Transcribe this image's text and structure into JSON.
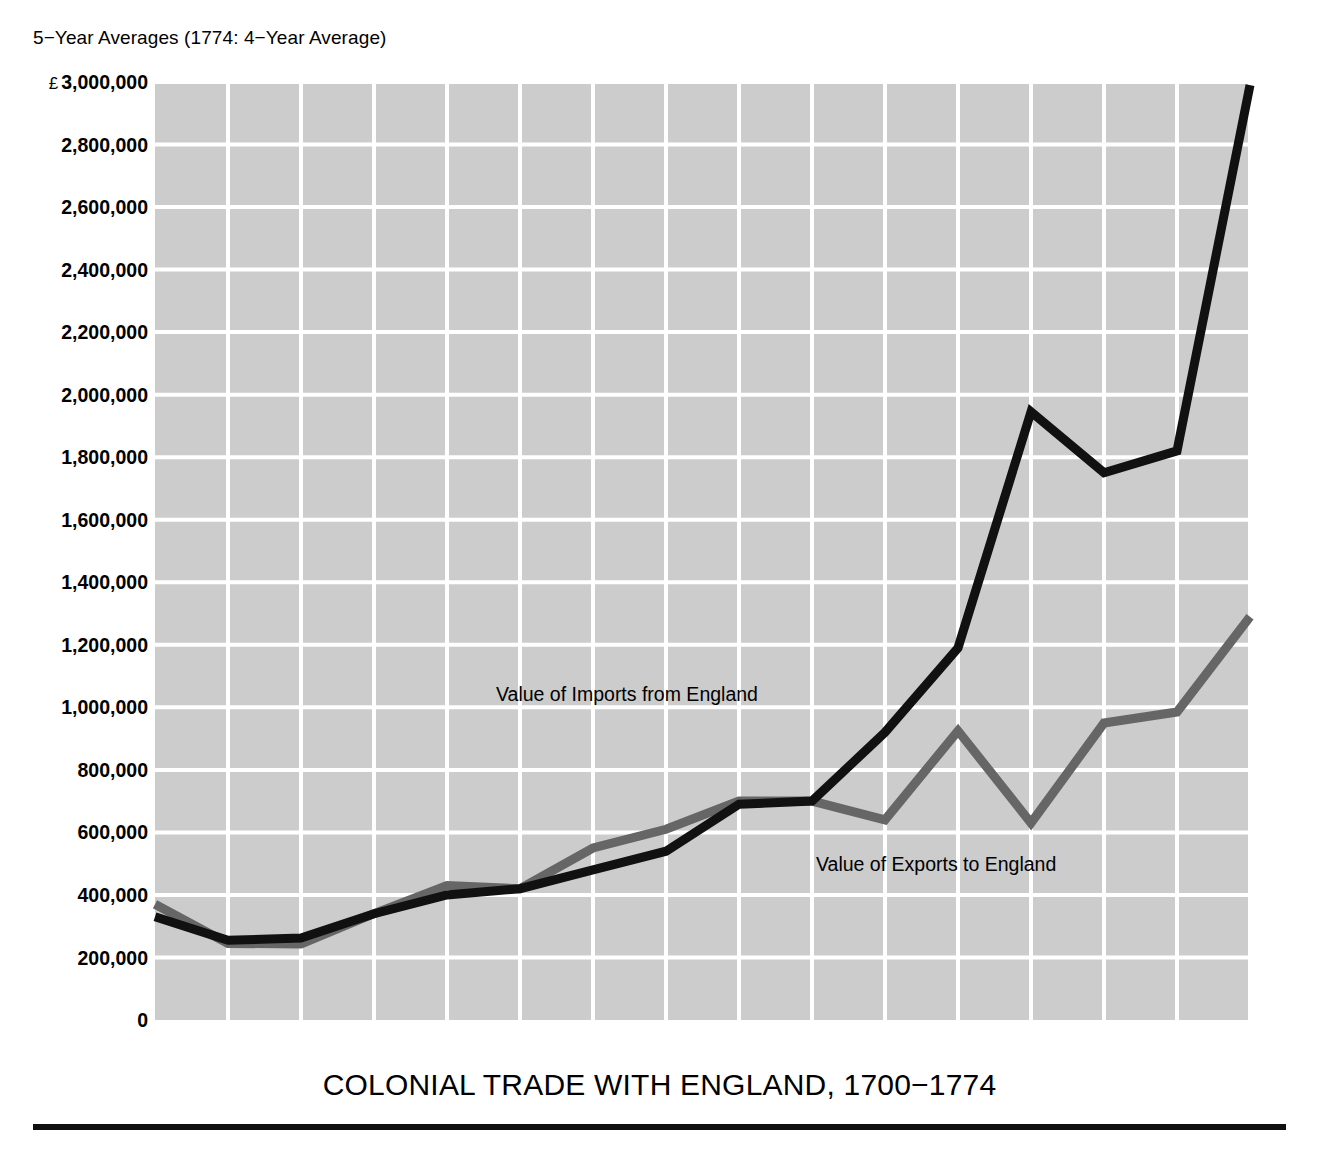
{
  "subtitle": "5−Year Averages (1774: 4−Year Average)",
  "title": "COLONIAL TRADE WITH ENGLAND, 1700−1774",
  "currency_symbol": "£",
  "colors": {
    "plot_background": "#cccccc",
    "gridline": "#ffffff",
    "imports_line": "#111111",
    "exports_line": "#666666",
    "text": "#000000",
    "rule": "#111111"
  },
  "annotations": {
    "imports_label": "Value of Imports from England",
    "exports_label": "Value of Exports to England"
  },
  "chart_data": {
    "type": "line",
    "title": "COLONIAL TRADE WITH ENGLAND, 1700−1774",
    "subtitle": "5−Year Averages (1774: 4−Year Average)",
    "xlabel": "",
    "ylabel": "£",
    "grid": true,
    "legend": "annotated-inline",
    "x": [
      1700,
      1705,
      1710,
      1715,
      1720,
      1725,
      1730,
      1735,
      1740,
      1745,
      1750,
      1755,
      1760,
      1765,
      1770,
      1774
    ],
    "xtick_labels": [
      "1700",
      "1705",
      "1710",
      "1715",
      "1720",
      "1725",
      "1730",
      "1735",
      "1740",
      "1745",
      "1750",
      "1755",
      "1760",
      "1765",
      "1770",
      "1774"
    ],
    "xlim": [
      1700,
      1774
    ],
    "ylim": [
      0,
      3000000
    ],
    "ytick_values": [
      0,
      200000,
      400000,
      600000,
      800000,
      1000000,
      1200000,
      1400000,
      1600000,
      1800000,
      2000000,
      2200000,
      2400000,
      2600000,
      2800000,
      3000000
    ],
    "ytick_labels": [
      "0",
      "200,000",
      "400,000",
      "600,000",
      "800,000",
      "1,000,000",
      "1,200,000",
      "1,400,000",
      "1,600,000",
      "1,800,000",
      "2,000,000",
      "2,200,000",
      "2,400,000",
      "2,600,000",
      "2,800,000",
      "£ 3,000,000"
    ],
    "series": [
      {
        "name": "Value of Imports from England",
        "color": "#111111",
        "values": [
          330000,
          255000,
          262000,
          340000,
          400000,
          420000,
          480000,
          540000,
          690000,
          700000,
          920000,
          1190000,
          1945000,
          1750000,
          1820000,
          2990000
        ]
      },
      {
        "name": "Value of Exports to England",
        "color": "#666666",
        "values": [
          370000,
          245000,
          243000,
          340000,
          430000,
          420000,
          550000,
          610000,
          700000,
          700000,
          640000,
          925000,
          630000,
          950000,
          985000,
          1290000
        ]
      }
    ]
  }
}
